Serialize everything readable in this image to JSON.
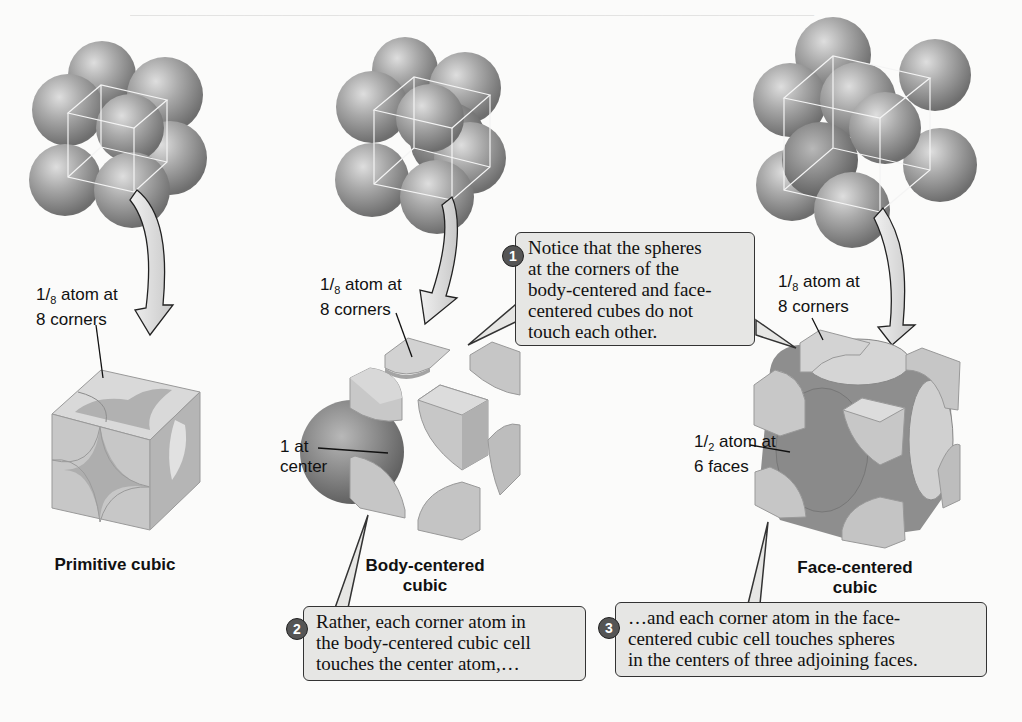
{
  "figure": {
    "cells": [
      {
        "id": "primitive",
        "title": "Primitive cubic",
        "labels": [
          {
            "fraction": "1/8",
            "text_pre": "1",
            "text_den": "8",
            "text_post": " atom at",
            "line2": "8 corners"
          }
        ]
      },
      {
        "id": "body-centered",
        "title_line1": "Body-centered",
        "title_line2": "cubic",
        "labels": [
          {
            "fraction": "1/8",
            "text_pre": "1",
            "text_den": "8",
            "text_post": " atom at",
            "line2": "8 corners"
          },
          {
            "line1": "1 at",
            "line2": "center"
          }
        ]
      },
      {
        "id": "face-centered",
        "title_line1": "Face-centered",
        "title_line2": "cubic",
        "labels": [
          {
            "fraction": "1/8",
            "text_pre": "1",
            "text_den": "8",
            "text_post": " atom at",
            "line2": "8 corners"
          },
          {
            "fraction": "1/2",
            "text_pre": "1",
            "text_den": "2",
            "text_post": " atom at",
            "line2": "6 faces"
          }
        ]
      }
    ],
    "callouts": [
      {
        "number": "1",
        "lines": [
          "Notice that the spheres",
          "at the corners of the",
          "body-centered and face-",
          "centered cubes do not",
          "touch each other."
        ]
      },
      {
        "number": "2",
        "lines": [
          "Rather, each corner atom in",
          "the body-centered cubic cell",
          "touches the center atom,…"
        ]
      },
      {
        "number": "3",
        "lines": [
          "…and each corner atom in the face-",
          "centered cubic cell touches spheres",
          "in the centers of three adjoining faces."
        ]
      }
    ]
  },
  "colors": {
    "sphere": "#9a9a9a",
    "sphere_highlight": "#d8d8d8",
    "cube_face_light": "#dcdcdc",
    "cube_face_mid": "#c4c4c4",
    "cube_face_dark": "#a8a8a8",
    "callout_bg": "#e6e6e4",
    "badge": "#555555",
    "paper": "#fbfbfa"
  }
}
